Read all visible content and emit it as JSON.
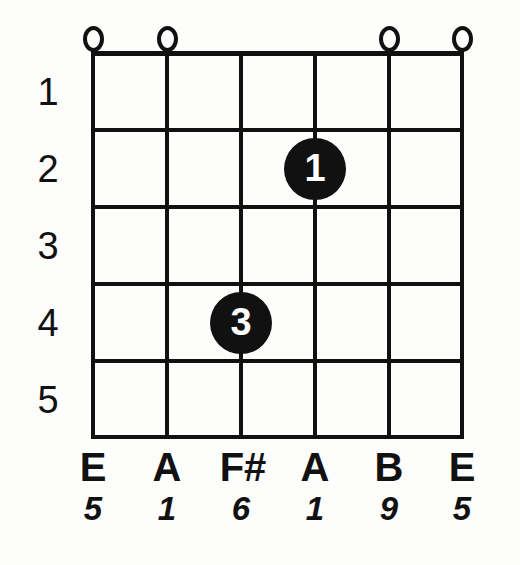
{
  "diagram": {
    "type": "guitar-chord-diagram",
    "strings": 6,
    "frets": 5,
    "colors": {
      "ink": "#111111",
      "background": "#fdfdfc",
      "dot_fill": "#111111",
      "dot_text": "#ffffff"
    }
  },
  "fret_numbers": [
    {
      "label": "1"
    },
    {
      "label": "2"
    },
    {
      "label": "3"
    },
    {
      "label": "4"
    },
    {
      "label": "5"
    }
  ],
  "open_markers": [
    {
      "string": 1,
      "symbol": "O"
    },
    {
      "string": 2,
      "symbol": "O"
    },
    {
      "string": 5,
      "symbol": "O"
    },
    {
      "string": 6,
      "symbol": "O"
    }
  ],
  "finger_dots": [
    {
      "finger": "1",
      "string": 4,
      "fret": 2
    },
    {
      "finger": "3",
      "string": 3,
      "fret": 4
    }
  ],
  "note_labels": [
    {
      "note": "E"
    },
    {
      "note": "A"
    },
    {
      "note": "F#"
    },
    {
      "note": "A"
    },
    {
      "note": "B"
    },
    {
      "note": "E"
    }
  ],
  "interval_labels": [
    {
      "interval": "5"
    },
    {
      "interval": "1"
    },
    {
      "interval": "6"
    },
    {
      "interval": "1"
    },
    {
      "interval": "9"
    },
    {
      "interval": "5"
    }
  ]
}
